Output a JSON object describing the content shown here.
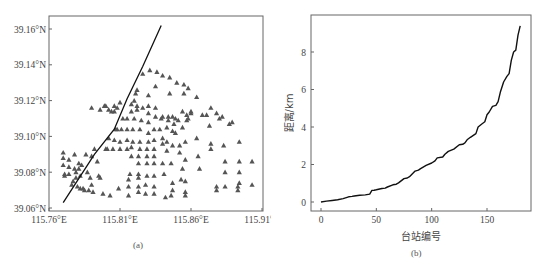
{
  "chart_data": [
    {
      "panel": "a",
      "type": "scatter",
      "title": "",
      "caption": "(a)",
      "xlabel": "",
      "ylabel": "",
      "xlim": [
        115.76,
        115.91
      ],
      "ylim": [
        39.06,
        39.165
      ],
      "x_ticks": [
        "115.76°E",
        "115.81°E",
        "115.86°E",
        "115.91°E"
      ],
      "x_tick_values": [
        115.76,
        115.81,
        115.86,
        115.91
      ],
      "y_ticks": [
        "39.06°N",
        "39.08°N",
        "39.10°N",
        "39.12°N",
        "39.14°N",
        "39.16°N"
      ],
      "y_tick_values": [
        39.06,
        39.08,
        39.1,
        39.12,
        39.14,
        39.16
      ],
      "grid": false,
      "series": [
        {
          "name": "stations",
          "marker": "triangle",
          "color": "#555555",
          "points": [
            [
              115.77,
              39.091
            ],
            [
              115.77,
              39.088
            ],
            [
              115.77,
              39.084
            ],
            [
              115.771,
              39.079
            ],
            [
              115.771,
              39.078
            ],
            [
              115.774,
              39.087
            ],
            [
              115.774,
              39.083
            ],
            [
              115.774,
              39.079
            ],
            [
              115.776,
              39.073
            ],
            [
              115.777,
              39.075
            ],
            [
              115.778,
              39.09
            ],
            [
              115.778,
              39.082
            ],
            [
              115.779,
              39.08
            ],
            [
              115.779,
              39.077
            ],
            [
              115.78,
              39.072
            ],
            [
              115.781,
              39.085
            ],
            [
              115.781,
              39.082
            ],
            [
              115.782,
              39.078
            ],
            [
              115.782,
              39.071
            ],
            [
              115.783,
              39.084
            ],
            [
              115.784,
              39.071
            ],
            [
              115.785,
              39.07
            ],
            [
              115.786,
              39.09
            ],
            [
              115.787,
              39.08
            ],
            [
              115.788,
              39.07
            ],
            [
              115.789,
              39.077
            ],
            [
              115.79,
              39.089
            ],
            [
              115.79,
              39.073
            ],
            [
              115.791,
              39.069
            ],
            [
              115.792,
              39.093
            ],
            [
              115.794,
              39.086
            ],
            [
              115.795,
              39.078
            ],
            [
              115.796,
              39.077
            ],
            [
              115.798,
              39.068
            ],
            [
              115.8,
              39.093
            ],
            [
              115.801,
              39.093
            ],
            [
              115.802,
              39.099
            ],
            [
              115.803,
              39.067
            ],
            [
              115.805,
              39.093
            ],
            [
              115.806,
              39.098
            ],
            [
              115.807,
              39.104
            ],
            [
              115.808,
              39.104
            ],
            [
              115.809,
              39.071
            ],
            [
              115.81,
              39.093
            ],
            [
              115.81,
              39.097
            ],
            [
              115.811,
              39.104
            ],
            [
              115.812,
              39.11
            ],
            [
              115.81,
              39.119
            ],
            [
              115.808,
              39.116
            ],
            [
              115.806,
              39.114
            ],
            [
              115.806,
              39.117
            ],
            [
              115.804,
              39.114
            ],
            [
              115.802,
              39.115
            ],
            [
              115.8,
              39.117
            ],
            [
              115.799,
              39.117
            ],
            [
              115.796,
              39.115
            ],
            [
              115.79,
              39.116
            ],
            [
              115.815,
              39.104
            ],
            [
              115.815,
              39.098
            ],
            [
              115.815,
              39.093
            ],
            [
              115.815,
              39.11
            ],
            [
              115.816,
              39.067
            ],
            [
              115.816,
              39.072
            ],
            [
              115.816,
              39.076
            ],
            [
              115.817,
              39.079
            ],
            [
              115.818,
              39.089
            ],
            [
              115.818,
              39.094
            ],
            [
              115.819,
              39.097
            ],
            [
              115.819,
              39.104
            ],
            [
              115.82,
              39.11
            ],
            [
              115.818,
              39.114
            ],
            [
              115.818,
              39.118
            ],
            [
              115.82,
              39.12
            ],
            [
              115.821,
              39.124
            ],
            [
              115.822,
              39.115
            ],
            [
              115.822,
              39.117
            ],
            [
              115.822,
              39.126
            ],
            [
              115.823,
              39.069
            ],
            [
              115.823,
              39.072
            ],
            [
              115.823,
              39.077
            ],
            [
              115.823,
              39.079
            ],
            [
              115.823,
              39.085
            ],
            [
              115.823,
              39.089
            ],
            [
              115.824,
              39.093
            ],
            [
              115.824,
              39.097
            ],
            [
              115.824,
              39.104
            ],
            [
              115.825,
              39.109
            ],
            [
              115.826,
              39.116
            ],
            [
              115.826,
              39.135
            ],
            [
              115.828,
              39.068
            ],
            [
              115.828,
              39.073
            ],
            [
              115.829,
              39.078
            ],
            [
              115.829,
              39.085
            ],
            [
              115.829,
              39.089
            ],
            [
              115.829,
              39.093
            ],
            [
              115.83,
              39.097
            ],
            [
              115.83,
              39.102
            ],
            [
              115.83,
              39.108
            ],
            [
              115.83,
              39.113
            ],
            [
              115.83,
              39.117
            ],
            [
              115.83,
              39.123
            ],
            [
              115.831,
              39.137
            ],
            [
              115.834,
              39.068
            ],
            [
              115.834,
              39.072
            ],
            [
              115.834,
              39.078
            ],
            [
              115.834,
              39.085
            ],
            [
              115.834,
              39.089
            ],
            [
              115.834,
              39.093
            ],
            [
              115.834,
              39.098
            ],
            [
              115.834,
              39.104
            ],
            [
              115.835,
              39.111
            ],
            [
              115.835,
              39.116
            ],
            [
              115.835,
              39.128
            ],
            [
              115.836,
              39.136
            ],
            [
              115.838,
              39.104
            ],
            [
              115.839,
              39.11
            ],
            [
              115.84,
              39.085
            ],
            [
              115.84,
              39.096
            ],
            [
              115.84,
              39.099
            ],
            [
              115.84,
              39.111
            ],
            [
              115.84,
              39.134
            ],
            [
              115.841,
              39.079
            ],
            [
              115.842,
              39.066
            ],
            [
              115.843,
              39.092
            ],
            [
              115.843,
              39.097
            ],
            [
              115.843,
              39.105
            ],
            [
              115.844,
              39.109
            ],
            [
              115.844,
              39.111
            ],
            [
              115.845,
              39.124
            ],
            [
              115.845,
              39.133
            ],
            [
              115.846,
              39.085
            ],
            [
              115.846,
              39.067
            ],
            [
              115.847,
              39.07
            ],
            [
              115.847,
              39.074
            ],
            [
              115.847,
              39.095
            ],
            [
              115.847,
              39.103
            ],
            [
              115.847,
              39.111
            ],
            [
              115.848,
              39.107
            ],
            [
              115.849,
              39.102
            ],
            [
              115.849,
              39.11
            ],
            [
              115.85,
              39.13
            ],
            [
              115.851,
              39.109
            ],
            [
              115.852,
              39.091
            ],
            [
              115.852,
              39.095
            ],
            [
              115.853,
              39.076
            ],
            [
              115.854,
              39.082
            ],
            [
              115.854,
              39.105
            ],
            [
              115.854,
              39.114
            ],
            [
              115.855,
              39.124
            ],
            [
              115.855,
              39.129
            ],
            [
              115.856,
              39.067
            ],
            [
              115.856,
              39.069
            ],
            [
              115.856,
              39.075
            ],
            [
              115.856,
              39.087
            ],
            [
              115.856,
              39.097
            ],
            [
              115.857,
              39.109
            ],
            [
              115.857,
              39.112
            ],
            [
              115.858,
              39.11
            ],
            [
              115.858,
              39.127
            ],
            [
              115.86,
              39.114
            ],
            [
              115.86,
              39.113
            ],
            [
              115.864,
              39.122
            ],
            [
              115.864,
              39.099
            ],
            [
              115.865,
              39.089
            ],
            [
              115.866,
              39.082
            ],
            [
              115.868,
              39.112
            ],
            [
              115.871,
              39.112
            ],
            [
              115.873,
              39.106
            ],
            [
              115.874,
              39.096
            ],
            [
              115.874,
              39.093
            ],
            [
              115.874,
              39.116
            ],
            [
              115.878,
              39.07
            ],
            [
              115.878,
              39.072
            ],
            [
              115.878,
              39.113
            ],
            [
              115.88,
              39.11
            ],
            [
              115.882,
              39.111
            ],
            [
              115.883,
              39.095
            ],
            [
              115.884,
              39.086
            ],
            [
              115.884,
              39.08
            ],
            [
              115.884,
              39.072
            ],
            [
              115.887,
              39.107
            ],
            [
              115.889,
              39.108
            ],
            [
              115.893,
              39.07
            ],
            [
              115.893,
              39.072
            ],
            [
              115.894,
              39.074
            ],
            [
              115.894,
              39.08
            ],
            [
              115.894,
              39.086
            ],
            [
              115.894,
              39.097
            ],
            [
              115.903,
              39.086
            ],
            [
              115.903,
              39.073
            ],
            [
              115.914,
              39.086
            ],
            [
              115.914,
              39.081
            ],
            [
              115.914,
              39.074
            ],
            [
              115.914,
              39.073
            ]
          ]
        },
        {
          "name": "fault-line",
          "type": "line",
          "color": "#111111",
          "points": [
            [
              115.77,
              39.063
            ],
            [
              115.792,
              39.09
            ],
            [
              115.806,
              39.104
            ],
            [
              115.815,
              39.121
            ],
            [
              115.826,
              39.139
            ],
            [
              115.839,
              39.162
            ]
          ]
        }
      ]
    },
    {
      "panel": "b",
      "type": "line",
      "title": "",
      "caption": "(b)",
      "xlabel": "台站编号",
      "ylabel": "距离/km",
      "xlim": [
        -5,
        185
      ],
      "ylim": [
        -0.5,
        9.8
      ],
      "x_ticks": [
        "0",
        "50",
        "100",
        "150"
      ],
      "x_tick_values": [
        0,
        50,
        100,
        150
      ],
      "y_ticks": [
        "0",
        "2",
        "4",
        "6",
        "8"
      ],
      "y_tick_values": [
        0,
        2,
        4,
        6,
        8
      ],
      "grid": false,
      "series": [
        {
          "name": "distance",
          "color": "#111111",
          "x": [
            0,
            5,
            10,
            15,
            20,
            25,
            28,
            30,
            35,
            40,
            44,
            46,
            48,
            50,
            55,
            58,
            60,
            65,
            68,
            70,
            75,
            78,
            80,
            85,
            88,
            90,
            95,
            100,
            103,
            105,
            110,
            112,
            115,
            120,
            125,
            128,
            130,
            132,
            135,
            140,
            142,
            145,
            148,
            150,
            152,
            155,
            158,
            160,
            162,
            165,
            168,
            170,
            172,
            174,
            176,
            178,
            180
          ],
          "values": [
            0,
            0.05,
            0.08,
            0.12,
            0.18,
            0.28,
            0.3,
            0.32,
            0.36,
            0.38,
            0.42,
            0.62,
            0.63,
            0.65,
            0.72,
            0.74,
            0.8,
            0.92,
            0.95,
            1.02,
            1.25,
            1.28,
            1.35,
            1.65,
            1.7,
            1.78,
            1.95,
            2.08,
            2.2,
            2.35,
            2.4,
            2.55,
            2.7,
            2.82,
            3.05,
            3.08,
            3.15,
            3.32,
            3.45,
            3.65,
            4.0,
            4.15,
            4.28,
            4.65,
            4.8,
            5.1,
            5.15,
            5.35,
            5.85,
            6.4,
            6.7,
            6.85,
            7.55,
            8.0,
            8.1,
            8.9,
            9.4
          ]
        }
      ]
    }
  ]
}
